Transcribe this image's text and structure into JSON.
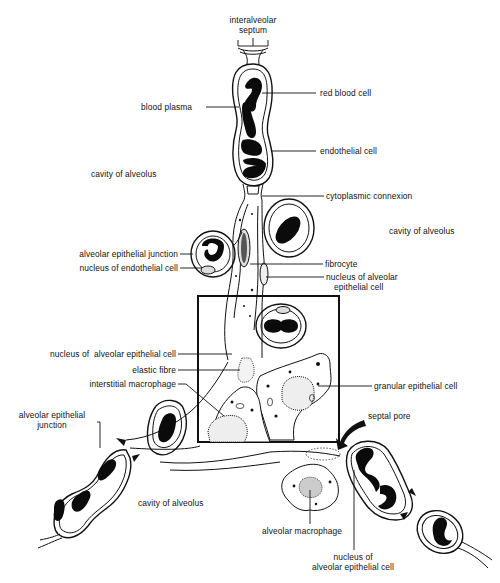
{
  "figure": {
    "highlight_box": {
      "x": 198,
      "y": 296,
      "width": 141,
      "height": 146
    }
  },
  "labels": {
    "interalveolar_septum": "interalveolar septum",
    "red_blood_cell": "red blood cell",
    "blood_plasma": "blood plasma",
    "endothelial_cell": "endothelial cell",
    "cavity_of_alveolus_upper_left": "cavity of alveolus",
    "cytoplasmic_connexion": "cytoplasmic connexion",
    "cavity_of_alveolus_right": "cavity of alveolus",
    "alveolar_epithelial_junction_upper": "alveolar epithelial junction",
    "fibrocyte": "fibrocyte",
    "nucleus_of_endothelial_cell": "nucleus of endothelial cell",
    "nucleus_of_alveolar_epithelial_cell_right_line1": "nucleus of alveolar",
    "nucleus_of_alveolar_epithelial_cell_right_line2": "epithelial cell",
    "nucleus_of_alveolar_epithelial_cell_left": "nucleus of  alveolar epithelial cell",
    "elastic_fibre": "elastic fibre",
    "interstitial_macrophage": "interstitial macrophage",
    "granular_epithelial_cell": "granular epithelial cell",
    "alveolar_epithelial_junction_lower_line1": "alveolar epithelial",
    "alveolar_epithelial_junction_lower_line2": "junction",
    "septal_pore": "septal pore",
    "cavity_of_alveolus_bottom": "cavity of alveolus",
    "alveolar_macrophage": "alveolar macrophage",
    "nucleus_of_alveolar_epithelial_cell_bottom_line1": "nucleus of",
    "nucleus_of_alveolar_epithelial_cell_bottom_line2": "alveolar epithelial cell"
  }
}
